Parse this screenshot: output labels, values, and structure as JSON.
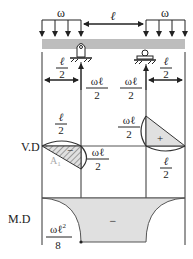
{
  "beam": {
    "left_load_label": "ω",
    "right_load_label": "ω",
    "span_label": "ℓ",
    "fill_color": "#bdbdbd"
  },
  "dimensions": {
    "left_overhang": {
      "num": "ℓ",
      "den": "2"
    },
    "right_overhang": {
      "num": "ℓ",
      "den": "2"
    },
    "left_reaction": {
      "num": "ωℓ",
      "den": "2"
    },
    "right_reaction": {
      "num": "ωℓ",
      "den": "2"
    }
  },
  "shear_diagram": {
    "label": "V.D",
    "left_top": {
      "num": "ℓ",
      "den": "2"
    },
    "left_value": {
      "num": "ωℓ",
      "den": "2"
    },
    "left_sign": "−",
    "area_label": "A",
    "area_sub": "1",
    "right_value": {
      "num": "ωℓ",
      "den": "2"
    },
    "right_sign": "+",
    "right_bottom": {
      "num": "ℓ",
      "den": "2"
    }
  },
  "moment_diagram": {
    "label": "M.D",
    "sign": "−",
    "value": {
      "num": "ωℓ",
      "sup": "2",
      "den": "8"
    },
    "fill_color": "#e0e0e0"
  },
  "colors": {
    "line": "#333333",
    "beam": "#bdbdbd",
    "shade": "#e0e0e0",
    "area_label": "#aaaaaa"
  }
}
